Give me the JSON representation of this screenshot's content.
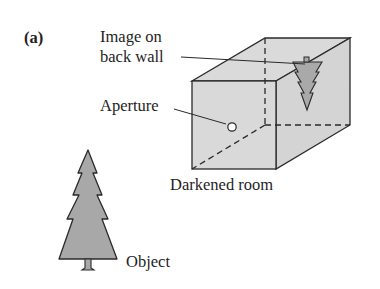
{
  "figure": {
    "panel_label": "(a)",
    "labels": {
      "image_line1": "Image on",
      "image_line2": "back wall",
      "aperture": "Aperture",
      "room": "Darkened room",
      "object": "Object"
    },
    "colors": {
      "box_fill": "#d9d9d9",
      "tree_fill": "#a8a8a8",
      "stroke": "#2a2a2a"
    }
  }
}
